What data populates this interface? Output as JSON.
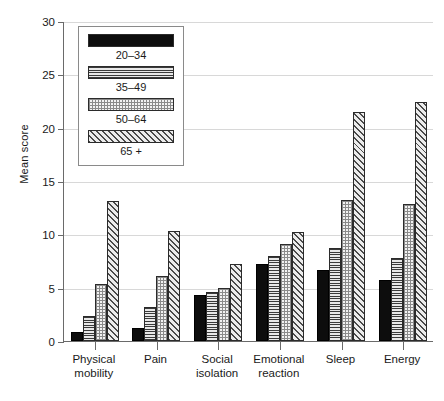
{
  "chart_data": {
    "type": "bar",
    "title": "",
    "xlabel": "",
    "ylabel": "Mean score",
    "ylim": [
      0,
      30
    ],
    "yticks": [
      0,
      5,
      10,
      15,
      20,
      25,
      30
    ],
    "grid": true,
    "legend_position": "upper-left-inside",
    "categories": [
      "Physical\nmobility",
      "Pain",
      "Social\nisolation",
      "Emotional\nreaction",
      "Sleep",
      "Energy"
    ],
    "series": [
      {
        "name": "20–34",
        "values": [
          0.8,
          1.2,
          4.3,
          7.2,
          6.7,
          5.7
        ],
        "fill": "solid-black",
        "color": "#0d0d0d"
      },
      {
        "name": "35–49",
        "values": [
          2.3,
          3.2,
          4.6,
          8.0,
          8.7,
          7.8
        ],
        "fill": "horizontal-lines",
        "color": "#808080"
      },
      {
        "name": "50–64",
        "values": [
          5.3,
          6.1,
          5.0,
          9.1,
          13.2,
          12.8
        ],
        "fill": "fine-dots",
        "color": "#dcdcdc"
      },
      {
        "name": "65 +",
        "values": [
          13.1,
          10.3,
          7.2,
          10.2,
          21.5,
          22.4
        ],
        "fill": "diagonal-hatch",
        "color": "#b0b0b0"
      }
    ]
  },
  "legend": {
    "items": [
      {
        "label": "20–34"
      },
      {
        "label": "35–49"
      },
      {
        "label": "50–64"
      },
      {
        "label": "65 +"
      }
    ]
  }
}
